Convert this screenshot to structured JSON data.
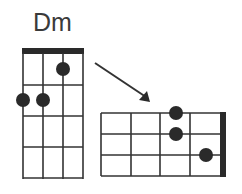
{
  "chord": {
    "name": "Dm",
    "vertical_diagram": {
      "strings": 4,
      "frets": 4,
      "dots": [
        {
          "string": 3,
          "fret": 1
        },
        {
          "string": 1,
          "fret": 2
        },
        {
          "string": 2,
          "fret": 2
        }
      ]
    },
    "horizontal_diagram": {
      "strings": 4,
      "frets": 4,
      "dots": [
        {
          "row": 1,
          "fret_from_nut": 2
        },
        {
          "row": 2,
          "fret_from_nut": 2
        },
        {
          "row": 3,
          "fret_from_nut": 1
        }
      ]
    },
    "arrow": "vertical-to-horizontal"
  },
  "colors": {
    "line": "#333333",
    "dot": "#2a2a2a",
    "text": "#3a3a3a"
  }
}
